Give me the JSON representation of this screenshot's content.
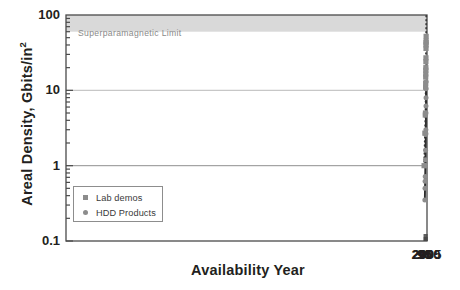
{
  "chart_data": {
    "type": "scatter",
    "title": "",
    "xlabel": "Availability Year",
    "ylabel": "Areal Density, Gbits/in",
    "ylabel_sup": "2",
    "xlim": [
      89,
      2005
    ],
    "ylim": [
      0.1,
      100
    ],
    "yscale": "log",
    "xtick_labels": [
      "90",
      "95",
      "2000",
      "2005"
    ],
    "xtick_values": [
      1990,
      1995,
      2000,
      2005
    ],
    "xminor_step": 1,
    "ytick_labels": [
      "100",
      "10",
      "1",
      "0.1"
    ],
    "ytick_values": [
      100,
      10,
      1,
      0.1
    ],
    "grid": "horizontal-major-only",
    "annotations": [
      {
        "name": "superparamagnetic-limit",
        "text": "Superparamagnetic Limit",
        "band_from": 60,
        "band_to": 100,
        "color": "#d9d9d9",
        "text_color": "#8a8a8a"
      },
      {
        "name": "projection-wedge",
        "text": "",
        "color": "#6e6e6e",
        "apex_year": 2000.6,
        "apex_value": 13,
        "end_year": 2002.4,
        "end_upper": 100,
        "end_lower": 25
      }
    ],
    "legend": {
      "position": "lower-left-inside",
      "entries": [
        {
          "label": "Lab demos",
          "marker": "square",
          "color": "#8c8c8c"
        },
        {
          "label": "HDD Products",
          "marker": "circle",
          "color": "#8c8c8c"
        }
      ]
    },
    "series": [
      {
        "name": "Lab demos",
        "marker": "square",
        "color": "#8c8c8c",
        "line": "dotted",
        "line_color": "#3a3a3a",
        "points": [
          {
            "x": 1989.6,
            "y": 1.0
          },
          {
            "x": 1993.6,
            "y": 2.7
          },
          {
            "x": 1996.0,
            "y": 4.7
          },
          {
            "x": 1996.9,
            "y": 5.0
          },
          {
            "x": 1997.6,
            "y": 11.0
          },
          {
            "x": 1997.9,
            "y": 12.5
          },
          {
            "x": 1998.1,
            "y": 15.0
          },
          {
            "x": 1998.45,
            "y": 16.5
          },
          {
            "x": 1998.7,
            "y": 18.5
          },
          {
            "x": 1998.95,
            "y": 20.0
          },
          {
            "x": 1999.15,
            "y": 24.0
          },
          {
            "x": 1999.45,
            "y": 27.0
          },
          {
            "x": 1999.7,
            "y": 36.0
          },
          {
            "x": 1999.9,
            "y": 40.0
          },
          {
            "x": 2000.05,
            "y": 43.0
          },
          {
            "x": 2000.2,
            "y": 45.0
          },
          {
            "x": 2000.4,
            "y": 52.0
          }
        ]
      },
      {
        "name": "HDD Products",
        "marker": "circle",
        "color": "#8c8c8c",
        "line": "solid",
        "line_color": "#2d2d2d",
        "points": [
          {
            "x": 1993.6,
            "y": 0.35
          },
          {
            "x": 1994.4,
            "y": 0.5
          },
          {
            "x": 1994.9,
            "y": 0.62
          },
          {
            "x": 1995.5,
            "y": 0.72
          },
          {
            "x": 1996.1,
            "y": 1.0
          },
          {
            "x": 1996.9,
            "y": 1.2
          },
          {
            "x": 1997.5,
            "y": 1.6
          },
          {
            "x": 1998.3,
            "y": 2.6
          },
          {
            "x": 1998.6,
            "y": 2.7
          },
          {
            "x": 1999.0,
            "y": 3.0
          },
          {
            "x": 1999.3,
            "y": 5.0
          },
          {
            "x": 1999.6,
            "y": 6.2
          },
          {
            "x": 1999.9,
            "y": 8.0
          },
          {
            "x": 2000.2,
            "y": 10.5
          },
          {
            "x": 2000.5,
            "y": 13.0
          }
        ]
      }
    ]
  },
  "axes": {
    "plot_left": 66,
    "plot_right": 427,
    "plot_top": 15,
    "plot_bottom": 241
  }
}
